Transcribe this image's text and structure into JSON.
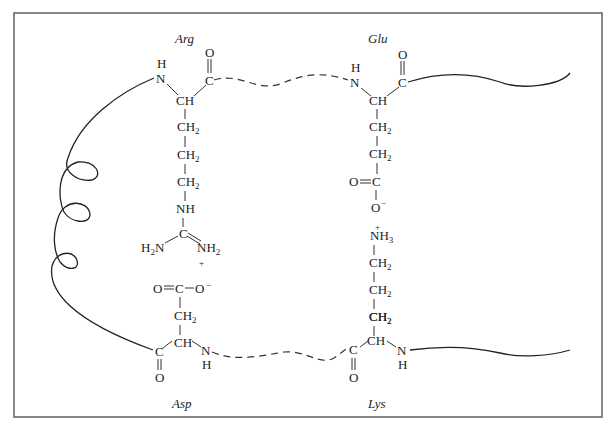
{
  "diagram": {
    "type": "salt-bridges-between-amino-acid-residues",
    "residues": {
      "arg": {
        "name": "Arg",
        "backbone": {
          "n": "N",
          "h": "H",
          "ca": "CH",
          "c": "C",
          "o": "O"
        },
        "side_chain": [
          "CH2",
          "CH2",
          "CH2",
          "NH",
          "C"
        ],
        "guanidinium": {
          "left": "H2N",
          "right": "NH2",
          "charge": "+"
        }
      },
      "glu": {
        "name": "Glu",
        "backbone": {
          "n": "N",
          "h": "H",
          "ca": "CH",
          "c": "C",
          "o": "O"
        },
        "side_chain": [
          "CH2",
          "CH2"
        ],
        "carboxylate": {
          "c": "C",
          "o_double": "O",
          "o_minus": "O",
          "charge": "−"
        }
      },
      "lys": {
        "name": "Lys",
        "backbone": {
          "n": "N",
          "h": "H",
          "ca": "CH",
          "c": "C",
          "o": "O"
        },
        "side_chain": [
          "CH2",
          "CH2",
          "CH2",
          "CH2"
        ],
        "amine": {
          "text": "NH3",
          "charge": "+"
        }
      },
      "asp": {
        "name": "Asp",
        "backbone": {
          "n": "N",
          "h": "H",
          "ca": "CH",
          "c": "C",
          "o": "O"
        },
        "side_chain": [
          "CH2"
        ],
        "carboxylate": {
          "c": "C",
          "o_double": "O",
          "o_minus": "O",
          "charge": "−"
        }
      }
    },
    "text": {
      "H": "H",
      "N": "N",
      "C": "C",
      "O": "O",
      "CH": "CH",
      "CH2": "CH",
      "sub2": "2",
      "sub3": "3",
      "NH": "NH",
      "plus": "+",
      "minus": "−",
      "H2N_a": "H",
      "H2N_b": "N",
      "arg_label": "Arg",
      "glu_label": "Glu",
      "lys_label": "Lys",
      "asp_label": "Asp"
    },
    "colors": {
      "line": "#222222",
      "frame": "#555555",
      "background": "#ffffff"
    }
  }
}
